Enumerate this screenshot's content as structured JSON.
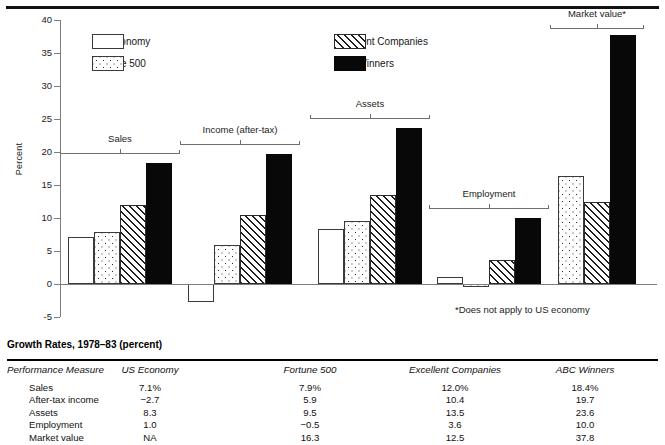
{
  "chart_data": {
    "type": "bar",
    "title": "",
    "xlabel": "",
    "ylabel": "Percent",
    "ylim": [
      -5,
      40
    ],
    "yticks": [
      -5,
      0,
      5,
      10,
      15,
      20,
      25,
      30,
      35,
      40
    ],
    "grid": false,
    "legend_position": "top-center",
    "categories": [
      "Sales",
      "Income (after-tax)",
      "Assets",
      "Employment",
      "Market value*"
    ],
    "series": [
      {
        "name": "US Economy",
        "pattern": "white",
        "values": [
          7.1,
          -2.7,
          8.3,
          1.0,
          null
        ]
      },
      {
        "name": "Fortune 500",
        "pattern": "dots",
        "values": [
          7.9,
          5.9,
          9.5,
          -0.5,
          16.3
        ]
      },
      {
        "name": "Excellent Companies",
        "pattern": "hatch",
        "values": [
          12.0,
          10.4,
          13.5,
          3.6,
          12.5
        ]
      },
      {
        "name": "ABC Winners",
        "pattern": "black",
        "values": [
          18.4,
          19.7,
          23.6,
          10.0,
          37.8
        ]
      }
    ],
    "annotations": [
      "*Does not apply to US economy"
    ]
  },
  "chart": {
    "y_axis_title": "Percent",
    "tick_labels": [
      "40",
      "35",
      "30",
      "25",
      "20",
      "15",
      "10",
      "5",
      "0",
      "-5"
    ],
    "group_labels": [
      "Sales",
      "Income (after-tax)",
      "Assets",
      "Employment",
      "Market value*"
    ],
    "footnote": "*Does not apply to US economy",
    "legend": [
      {
        "label": "US Economy",
        "pattern": "white"
      },
      {
        "label": "Fortune 500",
        "pattern": "dots"
      },
      {
        "label": "Excellent Companies",
        "pattern": "hatch"
      },
      {
        "label": "ABC Winners",
        "pattern": "black"
      }
    ]
  },
  "table": {
    "title": "Growth Rates, 1978–83 (percent)",
    "headers": [
      "Performance Measure",
      "US Economy",
      "Fortune 500",
      "Excellent Companies",
      "ABC Winners"
    ],
    "rows": [
      {
        "measure": "Sales",
        "us_economy": "7.1%",
        "fortune_500": "7.9%",
        "excellent_companies": "12.0%",
        "abc_winners": "18.4%"
      },
      {
        "measure": "After-tax income",
        "us_economy": "−2.7",
        "fortune_500": "5.9",
        "excellent_companies": "10.4",
        "abc_winners": "19.7"
      },
      {
        "measure": "Assets",
        "us_economy": "8.3",
        "fortune_500": "9.5",
        "excellent_companies": "13.5",
        "abc_winners": "23.6"
      },
      {
        "measure": "Employment",
        "us_economy": "1.0",
        "fortune_500": "−0.5",
        "excellent_companies": "3.6",
        "abc_winners": "10.0"
      },
      {
        "measure": "Market value",
        "us_economy": "NA",
        "fortune_500": "16.3",
        "excellent_companies": "12.5",
        "abc_winners": "37.8"
      }
    ]
  }
}
